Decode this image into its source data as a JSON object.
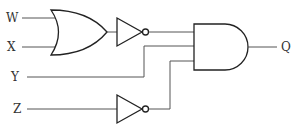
{
  "diagram": {
    "type": "logic-circuit",
    "inputs": [
      {
        "id": "W",
        "label": "W"
      },
      {
        "id": "X",
        "label": "X"
      },
      {
        "id": "Y",
        "label": "Y"
      },
      {
        "id": "Z",
        "label": "Z"
      }
    ],
    "output": {
      "id": "Q",
      "label": "Q"
    },
    "gates": [
      {
        "id": "or1",
        "type": "OR",
        "inputs": [
          "W",
          "X"
        ]
      },
      {
        "id": "not1",
        "type": "NOT",
        "inputs": [
          "or1"
        ]
      },
      {
        "id": "not2",
        "type": "NOT",
        "inputs": [
          "Z"
        ]
      },
      {
        "id": "and1",
        "type": "AND",
        "inputs": [
          "not1",
          "Y",
          "not2"
        ],
        "output": "Q"
      }
    ],
    "colors": {
      "wire": "#555555",
      "gate": "#222222",
      "text": "#333333",
      "background": "#ffffff"
    }
  }
}
